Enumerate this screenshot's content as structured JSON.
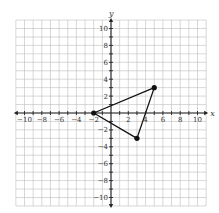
{
  "chart_data": {
    "type": "scatter",
    "title": "",
    "xlabel": "x",
    "ylabel": "y",
    "xlim": [
      -11,
      11
    ],
    "ylim": [
      -11,
      11
    ],
    "grid": true,
    "x_ticks": [
      -10,
      -8,
      -6,
      -4,
      -2,
      2,
      4,
      6,
      8,
      10
    ],
    "y_ticks": [
      -10,
      -8,
      -6,
      -4,
      -2,
      2,
      4,
      6,
      8,
      10
    ],
    "shape": "triangle",
    "vertices": [
      {
        "x": -2,
        "y": 0
      },
      {
        "x": 5,
        "y": 3
      },
      {
        "x": 3,
        "y": -3
      }
    ]
  },
  "layout": {
    "origin_px": [
      111,
      113
    ],
    "unit_x_px": 8.65,
    "unit_y_px": 8.45,
    "grid_color": "#bdbdbd",
    "axis_color": "#222222",
    "line_color": "#111111"
  }
}
